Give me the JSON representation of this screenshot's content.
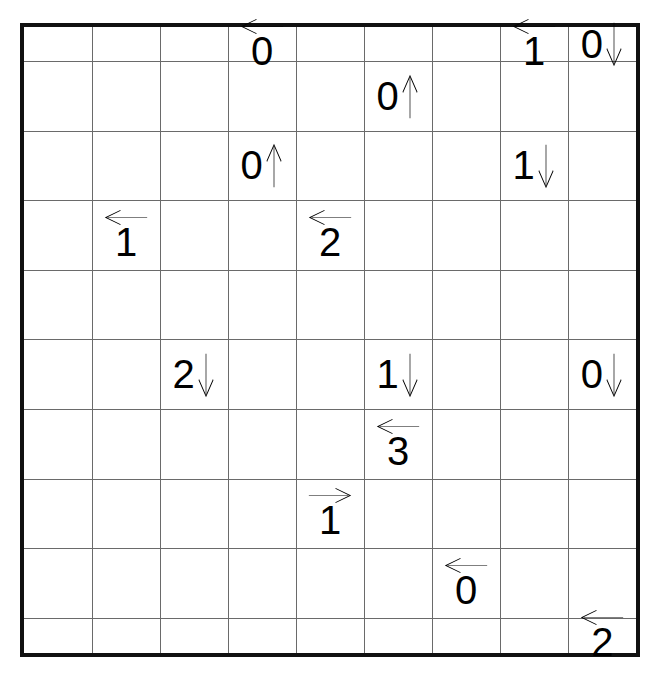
{
  "puzzle": {
    "type": "arrow-number-grid",
    "columns": 9,
    "rows": 10,
    "background_color": "#ffffff",
    "ink_color": "#000000",
    "grid_line_color": "#6a6a6a",
    "frame_color": "#111111",
    "arrow_glyphs": {
      "left": "←",
      "right": "→",
      "up": "↑",
      "down": "↓"
    },
    "clues": [
      {
        "row": 1,
        "col": 4,
        "number": "0",
        "arrow": "left",
        "arrow_position": "above",
        "label": "0 ←"
      },
      {
        "row": 1,
        "col": 8,
        "number": "1",
        "arrow": "left",
        "arrow_position": "above",
        "label": "1 ←"
      },
      {
        "row": 1,
        "col": 9,
        "number": "0",
        "arrow": "down",
        "arrow_position": "right",
        "label": "0 ↓"
      },
      {
        "row": 2,
        "col": 6,
        "number": "0",
        "arrow": "up",
        "arrow_position": "right",
        "label": "0 ↑"
      },
      {
        "row": 3,
        "col": 4,
        "number": "0",
        "arrow": "up",
        "arrow_position": "right",
        "label": "0 ↑"
      },
      {
        "row": 3,
        "col": 8,
        "number": "1",
        "arrow": "down",
        "arrow_position": "right",
        "label": "1 ↓"
      },
      {
        "row": 4,
        "col": 2,
        "number": "1",
        "arrow": "left",
        "arrow_position": "above",
        "label": "1 ←"
      },
      {
        "row": 4,
        "col": 5,
        "number": "2",
        "arrow": "left",
        "arrow_position": "above",
        "label": "2 ←"
      },
      {
        "row": 6,
        "col": 3,
        "number": "2",
        "arrow": "down",
        "arrow_position": "right",
        "label": "2 ↓"
      },
      {
        "row": 6,
        "col": 6,
        "number": "1",
        "arrow": "down",
        "arrow_position": "right",
        "label": "1 ↓"
      },
      {
        "row": 6,
        "col": 9,
        "number": "0",
        "arrow": "down",
        "arrow_position": "right",
        "label": "0 ↓"
      },
      {
        "row": 7,
        "col": 6,
        "number": "3",
        "arrow": "left",
        "arrow_position": "above",
        "label": "3 ←"
      },
      {
        "row": 8,
        "col": 5,
        "number": "1",
        "arrow": "right",
        "arrow_position": "above",
        "label": "1 →"
      },
      {
        "row": 9,
        "col": 7,
        "number": "0",
        "arrow": "left",
        "arrow_position": "above",
        "label": "0 ←"
      },
      {
        "row": 10,
        "col": 9,
        "number": "2",
        "arrow": "left",
        "arrow_position": "above",
        "label": "2 ←"
      }
    ]
  }
}
